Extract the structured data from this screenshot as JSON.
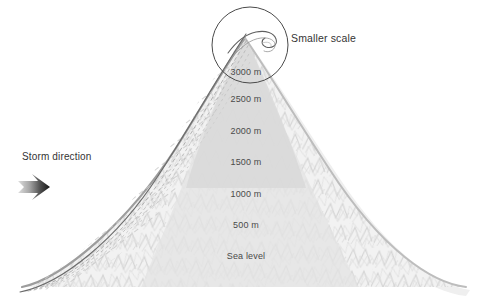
{
  "figure": {
    "width": 485,
    "height": 306,
    "background": "#ffffff"
  },
  "annotations": {
    "storm_direction": {
      "label": "Storm direction",
      "x": 22,
      "y": 152,
      "arrow": {
        "name": "storm-direction-arrow",
        "x": 18,
        "y": 173,
        "width": 50,
        "height": 28,
        "gradient_from": "#d8d8d8",
        "gradient_to": "#1a1a1a"
      }
    },
    "smaller_scale": {
      "label": "Smaller scale",
      "x": 291,
      "y": 33,
      "circle": {
        "name": "smaller-scale-circle",
        "cx": 250,
        "cy": 45,
        "r": 38,
        "stroke": "#4a4a4a"
      }
    }
  },
  "elevations": [
    {
      "label": "3000 m",
      "x": 246,
      "y": 68,
      "value": 3000,
      "unit": "m"
    },
    {
      "label": "2500 m",
      "x": 246,
      "y": 95,
      "value": 2500,
      "unit": "m"
    },
    {
      "label": "2000 m",
      "x": 246,
      "y": 127,
      "value": 2000,
      "unit": "m"
    },
    {
      "label": "1500 m",
      "x": 246,
      "y": 158,
      "value": 1500,
      "unit": "m"
    },
    {
      "label": "1000 m",
      "x": 246,
      "y": 190,
      "value": 1000,
      "unit": "m"
    },
    {
      "label": "500 m",
      "x": 246,
      "y": 221,
      "value": 500,
      "unit": "m"
    },
    {
      "label": "Sea level",
      "x": 246,
      "y": 252,
      "value": 0,
      "unit": "m"
    }
  ],
  "colors": {
    "mountain_fill": "#ececec",
    "mountain_edge": "#9a9a9a",
    "flow_line": "#5a5a5a",
    "hatch": "#cfcfcf",
    "text": "#3b3b3b",
    "background": "#ffffff"
  },
  "geometry": {
    "summit": {
      "x": 245,
      "y": 38
    },
    "base_left": {
      "x": 22,
      "y": 287
    },
    "base_right": {
      "x": 466,
      "y": 287
    }
  }
}
